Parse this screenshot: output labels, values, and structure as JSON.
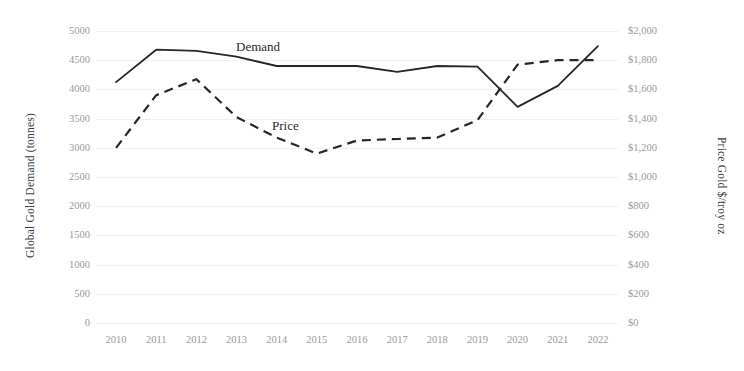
{
  "chart_data": {
    "type": "line",
    "title": "",
    "xlabel": "",
    "categories": [
      "2010",
      "2011",
      "2012",
      "2013",
      "2014",
      "2015",
      "2016",
      "2017",
      "2018",
      "2019",
      "2020",
      "2021",
      "2022"
    ],
    "grid": "horizontal",
    "legend_position": "inline-annotation",
    "axes": {
      "left": {
        "label": "Global Gold Demand (tonnes)",
        "ticks": [
          "0",
          "500",
          "1000",
          "1500",
          "2000",
          "2500",
          "3000",
          "3500",
          "4000",
          "4500",
          "5000"
        ],
        "tick_values": [
          0,
          500,
          1000,
          1500,
          2000,
          2500,
          3000,
          3500,
          4000,
          4500,
          5000
        ],
        "min": 0,
        "max": 5000
      },
      "right": {
        "label": "Price Gold $/troy oz",
        "ticks": [
          "$0",
          "$200",
          "$400",
          "$600",
          "$800",
          "$1,000",
          "$1,200",
          "$1,400",
          "$1,600",
          "$1,800",
          "$2,000"
        ],
        "tick_values": [
          0,
          200,
          400,
          600,
          800,
          1000,
          1200,
          1400,
          1600,
          1800,
          2000
        ],
        "min": 0,
        "max": 2000
      }
    },
    "series": [
      {
        "name": "Demand",
        "annotation": "Demand",
        "axis": "left",
        "style": "solid",
        "color": "#262626",
        "values": [
          4125,
          4680,
          4660,
          4560,
          4400,
          4400,
          4400,
          4300,
          4400,
          4390,
          3700,
          4060,
          4740
        ]
      },
      {
        "name": "Price",
        "annotation": "Price",
        "axis": "right",
        "style": "dashed",
        "color": "#262626",
        "values": [
          1200,
          1560,
          1670,
          1410,
          1270,
          1160,
          1250,
          1260,
          1270,
          1390,
          1770,
          1800,
          1800
        ]
      }
    ]
  }
}
